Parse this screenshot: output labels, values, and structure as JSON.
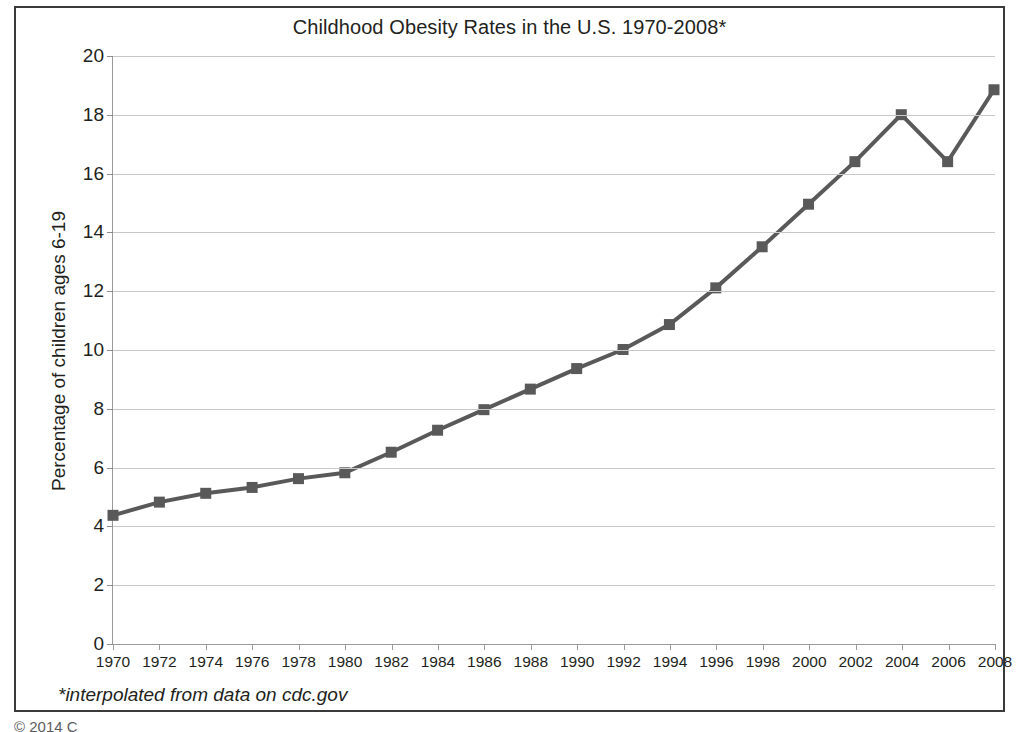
{
  "figure": {
    "title": "Childhood Obesity Rates in the U.S. 1970-2008*",
    "footnote": "*interpolated from data on cdc.gov",
    "copyright": "© 2014 C",
    "line_color": "#595959",
    "marker_color": "#595959",
    "gridline_color": "#c9c9c9",
    "axis_color": "#9a9a9a",
    "border_color": "#3a3a3a",
    "background": "#ffffff"
  },
  "chart_data": {
    "type": "line",
    "title": "Childhood Obesity Rates in the U.S. 1970-2008*",
    "xlabel": "",
    "ylabel": "Percentage of children ages 6-19",
    "xlim": [
      1970,
      2008
    ],
    "ylim": [
      0,
      20
    ],
    "grid": true,
    "legend": "none",
    "annotations": [
      "*interpolated from data on cdc.gov"
    ],
    "ytick_labels": [
      "0",
      "2",
      "4",
      "6",
      "8",
      "10",
      "12",
      "14",
      "16",
      "18",
      "20"
    ],
    "yticks": [
      0,
      2,
      4,
      6,
      8,
      10,
      12,
      14,
      16,
      18,
      20
    ],
    "categories": [
      "1970",
      "1972",
      "1974",
      "1976",
      "1978",
      "1980",
      "1982",
      "1984",
      "1986",
      "1988",
      "1990",
      "1992",
      "1994",
      "1996",
      "1998",
      "2000",
      "2002",
      "2004",
      "2006",
      "2008"
    ],
    "x": [
      1970,
      1972,
      1974,
      1976,
      1978,
      1980,
      1982,
      1984,
      1986,
      1988,
      1990,
      1992,
      1994,
      1996,
      1998,
      2000,
      2002,
      2004,
      2006,
      2008
    ],
    "values": [
      4.35,
      4.8,
      5.1,
      5.3,
      5.6,
      5.8,
      6.5,
      7.25,
      7.95,
      8.65,
      9.35,
      10.0,
      10.85,
      12.1,
      13.5,
      14.95,
      16.4,
      18.0,
      16.4,
      18.85
    ],
    "series": [
      {
        "name": "Percentage of children ages 6-19",
        "values": [
          4.35,
          4.8,
          5.1,
          5.3,
          5.6,
          5.8,
          6.5,
          7.25,
          7.95,
          8.65,
          9.35,
          10.0,
          10.85,
          12.1,
          13.5,
          14.95,
          16.4,
          18.0,
          16.4,
          18.85
        ],
        "marker": "square",
        "color": "#595959"
      }
    ]
  }
}
